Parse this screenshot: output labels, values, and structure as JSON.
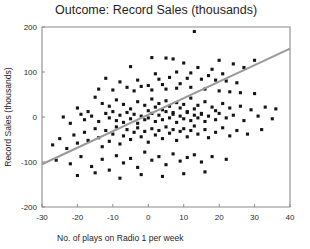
{
  "chart_data": {
    "type": "scatter",
    "title": "Outcome: Record Sales (thousands)",
    "xlabel": "No. of plays on Radio 1 per week",
    "ylabel": "Record Sales (thousands)",
    "xlim": [
      -30,
      40
    ],
    "ylim": [
      -200,
      200
    ],
    "xticks": [
      -30,
      -20,
      -10,
      0,
      10,
      20,
      30,
      40
    ],
    "yticks": [
      -200,
      -100,
      0,
      100,
      200
    ],
    "xtick_labels": [
      "-30",
      "-20",
      "-10",
      "0",
      "10",
      "20",
      "30",
      "40"
    ],
    "ytick_labels": [
      "-200",
      "-100",
      "0",
      "100",
      "200"
    ],
    "grid": false,
    "legend": false,
    "marker": "square",
    "marker_color": "#141414",
    "marker_size_px": 3.1,
    "trendline": {
      "type": "linear",
      "color": "#9a9a9a",
      "x_start": -30,
      "y_start": -105,
      "x_end": 40,
      "y_end": 152
    },
    "points": [
      [
        13,
        190
      ],
      [
        1,
        132
      ],
      [
        5,
        131
      ],
      [
        7,
        129
      ],
      [
        20,
        126
      ],
      [
        30,
        126
      ],
      [
        24,
        118
      ],
      [
        10,
        120
      ],
      [
        -5,
        112
      ],
      [
        27,
        110
      ],
      [
        14,
        110
      ],
      [
        18,
        106
      ],
      [
        -12,
        86
      ],
      [
        2,
        96
      ],
      [
        8,
        100
      ],
      [
        12,
        98
      ],
      [
        21,
        96
      ],
      [
        17,
        92
      ],
      [
        -8,
        78
      ],
      [
        -3,
        82
      ],
      [
        3,
        84
      ],
      [
        6,
        88
      ],
      [
        11,
        86
      ],
      [
        15,
        84
      ],
      [
        19,
        82
      ],
      [
        22,
        80
      ],
      [
        25,
        76
      ],
      [
        9,
        74
      ],
      [
        4,
        72
      ],
      [
        0,
        70
      ],
      [
        -2,
        68
      ],
      [
        -6,
        66
      ],
      [
        -14,
        62
      ],
      [
        -10,
        60
      ],
      [
        -4,
        58
      ],
      [
        1,
        60
      ],
      [
        5,
        62
      ],
      [
        8,
        64
      ],
      [
        12,
        66
      ],
      [
        16,
        62
      ],
      [
        20,
        58
      ],
      [
        23,
        56
      ],
      [
        26,
        54
      ],
      [
        30,
        52
      ],
      [
        -20,
        20
      ],
      [
        -17,
        12
      ],
      [
        -15,
        44
      ],
      [
        -13,
        30
      ],
      [
        -11,
        24
      ],
      [
        -9,
        38
      ],
      [
        -7,
        28
      ],
      [
        -5,
        18
      ],
      [
        -3,
        34
      ],
      [
        -1,
        26
      ],
      [
        0,
        14
      ],
      [
        1,
        40
      ],
      [
        2,
        22
      ],
      [
        3,
        30
      ],
      [
        4,
        16
      ],
      [
        5,
        36
      ],
      [
        6,
        24
      ],
      [
        7,
        10
      ],
      [
        8,
        32
      ],
      [
        9,
        20
      ],
      [
        10,
        28
      ],
      [
        11,
        12
      ],
      [
        12,
        42
      ],
      [
        13,
        18
      ],
      [
        14,
        26
      ],
      [
        15,
        8
      ],
      [
        16,
        34
      ],
      [
        18,
        22
      ],
      [
        19,
        14
      ],
      [
        21,
        30
      ],
      [
        23,
        20
      ],
      [
        26,
        24
      ],
      [
        29,
        16
      ],
      [
        33,
        22
      ],
      [
        36,
        18
      ],
      [
        -24,
        0
      ],
      [
        -22,
        -14
      ],
      [
        -19,
        6
      ],
      [
        -18,
        -6
      ],
      [
        -16,
        2
      ],
      [
        -14,
        -10
      ],
      [
        -12,
        8
      ],
      [
        -11,
        -2
      ],
      [
        -10,
        12
      ],
      [
        -9,
        -8
      ],
      [
        -8,
        4
      ],
      [
        -7,
        -12
      ],
      [
        -6,
        10
      ],
      [
        -5,
        -4
      ],
      [
        -4,
        6
      ],
      [
        -3,
        -14
      ],
      [
        -2,
        2
      ],
      [
        -1,
        -6
      ],
      [
        0,
        -2
      ],
      [
        1,
        8
      ],
      [
        2,
        -10
      ],
      [
        3,
        4
      ],
      [
        4,
        -6
      ],
      [
        5,
        12
      ],
      [
        6,
        -2
      ],
      [
        7,
        6
      ],
      [
        8,
        -12
      ],
      [
        9,
        2
      ],
      [
        10,
        -4
      ],
      [
        11,
        10
      ],
      [
        12,
        -8
      ],
      [
        13,
        4
      ],
      [
        14,
        -2
      ],
      [
        15,
        6
      ],
      [
        16,
        -10
      ],
      [
        17,
        2
      ],
      [
        19,
        -6
      ],
      [
        20,
        8
      ],
      [
        22,
        -2
      ],
      [
        24,
        4
      ],
      [
        27,
        -8
      ],
      [
        31,
        2
      ],
      [
        35,
        -4
      ],
      [
        -27,
        -62
      ],
      [
        -25,
        -48
      ],
      [
        -23,
        -70
      ],
      [
        -21,
        -40
      ],
      [
        -20,
        -58
      ],
      [
        -18,
        -34
      ],
      [
        -17,
        -52
      ],
      [
        -15,
        -26
      ],
      [
        -14,
        -46
      ],
      [
        -13,
        -66
      ],
      [
        -12,
        -30
      ],
      [
        -11,
        -54
      ],
      [
        -10,
        -38
      ],
      [
        -9,
        -22
      ],
      [
        -8,
        -60
      ],
      [
        -7,
        -42
      ],
      [
        -6,
        -28
      ],
      [
        -5,
        -50
      ],
      [
        -4,
        -34
      ],
      [
        -3,
        -24
      ],
      [
        -2,
        -44
      ],
      [
        -1,
        -32
      ],
      [
        0,
        -56
      ],
      [
        1,
        -26
      ],
      [
        2,
        -40
      ],
      [
        3,
        -30
      ],
      [
        4,
        -48
      ],
      [
        5,
        -22
      ],
      [
        6,
        -36
      ],
      [
        7,
        -28
      ],
      [
        8,
        -52
      ],
      [
        9,
        -32
      ],
      [
        10,
        -26
      ],
      [
        11,
        -44
      ],
      [
        12,
        -30
      ],
      [
        13,
        -20
      ],
      [
        14,
        -38
      ],
      [
        16,
        -28
      ],
      [
        17,
        -46
      ],
      [
        19,
        -34
      ],
      [
        21,
        -24
      ],
      [
        23,
        -42
      ],
      [
        25,
        -30
      ],
      [
        28,
        -38
      ],
      [
        32,
        -28
      ],
      [
        -26,
        -96
      ],
      [
        -22,
        -104
      ],
      [
        -19,
        -88
      ],
      [
        -16,
        -110
      ],
      [
        -13,
        -94
      ],
      [
        -11,
        -118
      ],
      [
        -9,
        -86
      ],
      [
        -7,
        -102
      ],
      [
        -5,
        -92
      ],
      [
        -3,
        -112
      ],
      [
        -1,
        -78
      ],
      [
        1,
        -96
      ],
      [
        3,
        -88
      ],
      [
        5,
        -106
      ],
      [
        7,
        -82
      ],
      [
        9,
        -98
      ],
      [
        11,
        -90
      ],
      [
        13,
        -84
      ],
      [
        15,
        -100
      ],
      [
        18,
        -88
      ],
      [
        22,
        -94
      ],
      [
        -20,
        -130
      ],
      [
        -15,
        -124
      ],
      [
        -8,
        -136
      ],
      [
        -2,
        -128
      ],
      [
        4,
        -132
      ],
      [
        10,
        -126
      ],
      [
        16,
        -122
      ]
    ]
  }
}
